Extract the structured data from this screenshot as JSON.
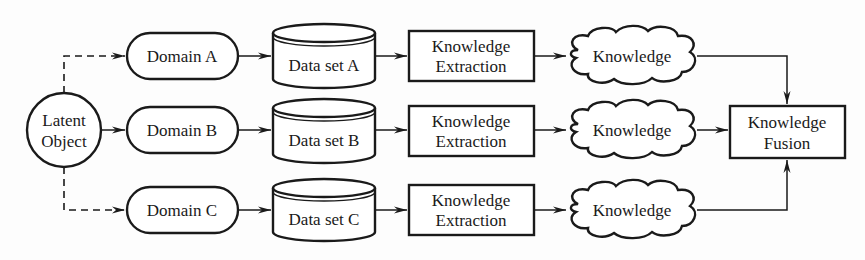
{
  "diagram": {
    "type": "flowchart",
    "colors": {
      "stroke": "#1a1a1a",
      "fill": "#ffffff",
      "background": "#fdfdfd"
    },
    "source": {
      "line1": "Latent",
      "line2": "Object",
      "shape": "circle"
    },
    "rows": [
      {
        "domain": "Domain A",
        "dataset": "Data set A",
        "extraction": {
          "line1": "Knowledge",
          "line2": "Extraction"
        },
        "knowledge": "Knowledge",
        "source_link": "dashed"
      },
      {
        "domain": "Domain B",
        "dataset": "Data set B",
        "extraction": {
          "line1": "Knowledge",
          "line2": "Extraction"
        },
        "knowledge": "Knowledge",
        "source_link": "solid"
      },
      {
        "domain": "Domain C",
        "dataset": "Data set C",
        "extraction": {
          "line1": "Knowledge",
          "line2": "Extraction"
        },
        "knowledge": "Knowledge",
        "source_link": "dashed"
      }
    ],
    "sink": {
      "line1": "Knowledge",
      "line2": "Fusion",
      "shape": "rectangle"
    },
    "flow": [
      "Latent Object",
      "Domain",
      "Data set",
      "Knowledge Extraction",
      "Knowledge",
      "Knowledge Fusion"
    ]
  }
}
